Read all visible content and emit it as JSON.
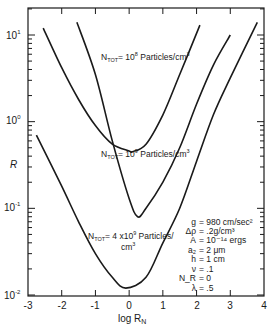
{
  "chart_data": {
    "type": "line",
    "title": "",
    "xlabel": "log R_N",
    "ylabel": "R",
    "xlim": [
      -3,
      4
    ],
    "ylim": [
      0.01,
      15
    ],
    "yscale": "log",
    "x_ticks": [
      "-3",
      "-2",
      "-1",
      "0",
      "1",
      "2",
      "3",
      "4"
    ],
    "y_ticks": [
      "10^-2",
      "10^-1",
      "10^0",
      "10^1"
    ],
    "grid": false,
    "series": [
      {
        "name": "N_TOT = 10^8 Particles/cm^3",
        "x": [
          -2.55,
          -2.0,
          -1.5,
          -1.0,
          -0.5,
          0.0,
          0.1,
          0.5,
          1.0,
          1.5,
          2.1
        ],
        "values": [
          12,
          4.2,
          1.8,
          0.9,
          0.55,
          0.46,
          0.45,
          0.55,
          1.2,
          3.5,
          13
        ]
      },
      {
        "name": "N_TOT = 10^9 Particles/cm^3",
        "x": [
          -1.55,
          -1.0,
          -0.5,
          0.0,
          0.25,
          0.5,
          1.0,
          1.5,
          2.0,
          2.5,
          3.0
        ],
        "values": [
          14,
          3.5,
          0.6,
          0.13,
          0.08,
          0.1,
          0.2,
          0.5,
          1.6,
          4.5,
          10
        ]
      },
      {
        "name": "N_TOT = 4x10^9 Particles/cm^3",
        "x": [
          -2.75,
          -2.0,
          -1.5,
          -1.0,
          -0.5,
          -0.1,
          0.5,
          1.0,
          1.5,
          2.0,
          2.5,
          3.0,
          3.8
        ],
        "values": [
          0.7,
          0.18,
          0.07,
          0.03,
          0.016,
          0.012,
          0.016,
          0.04,
          0.1,
          0.35,
          1.2,
          3.2,
          14
        ]
      }
    ],
    "annotations": [
      {
        "text": "N_TOT = 10^8 Particles/cm^3"
      },
      {
        "text": "N_TOT = 10^9 Particles/cm^3"
      },
      {
        "text": "N_TOT = 4x10^9 Particles/cm^3"
      }
    ],
    "parameters": [
      {
        "symbol": "g",
        "value": "= 980 cm/sec²"
      },
      {
        "symbol": "Δρ",
        "value": "= .2g/cm³"
      },
      {
        "symbol": "A",
        "value": "= 10⁻¹⁴ ergs"
      },
      {
        "symbol": "a₂",
        "value": "= 2 μm"
      },
      {
        "symbol": "h",
        "value": "= 1 cm"
      },
      {
        "symbol": "ν",
        "value": "= .1"
      },
      {
        "symbol": "N_R",
        "value": "= 0"
      },
      {
        "symbol": "λ",
        "value": "= .5"
      }
    ],
    "legend_position": "none"
  },
  "labels": {
    "xlabel_main": "log R",
    "xlabel_sub": "N",
    "ylabel": "R",
    "ytick_base": "10",
    "ytick_exp": [
      "1",
      "0",
      "-1",
      "-2"
    ],
    "xticks": [
      "-3",
      "-2",
      "-1",
      "0",
      "1",
      "2",
      "3",
      "4"
    ],
    "curve1": {
      "pre": "N",
      "sub": "TOT",
      "mid": "= 10",
      "exp": "8",
      "post": " Particles/cm",
      "exp2": "3"
    },
    "curve2": {
      "pre": "N",
      "sub": "TOT",
      "mid": "= 10",
      "exp": "9",
      "post": " Particles/cm",
      "exp2": "3"
    },
    "curve3": {
      "pre": "N",
      "sub": "TOT",
      "mid": "= 4 x10",
      "exp": "9",
      "post": " Particles/",
      "line2": "cm",
      "exp2": "3"
    },
    "params": [
      {
        "sym": "g",
        "val": "= 980 cm/sec²"
      },
      {
        "sym": "Δρ",
        "val": "= .2g/cm³"
      },
      {
        "sym": "A",
        "val": "= 10⁻¹⁴ ergs"
      },
      {
        "sym": "a₂",
        "val": "= 2 μm"
      },
      {
        "sym": "h",
        "val": "= 1 cm"
      },
      {
        "sym": "ν",
        "val": "= .1"
      },
      {
        "sym": "N_R",
        "val": "= 0"
      },
      {
        "sym": "λ",
        "val": "= .5"
      }
    ]
  }
}
